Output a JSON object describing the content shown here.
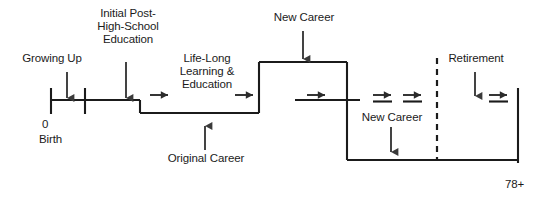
{
  "diagram": {
    "type": "timeline-step-diagram",
    "background_color": "#ffffff",
    "line_color": "#1b1b1b",
    "text_color": "#1b1b1b",
    "canvas": {
      "width": 546,
      "height": 202
    },
    "axis": {
      "start_value": "0",
      "start_label": "Birth",
      "end_label": "78+"
    },
    "labels": {
      "growing_up": "Growing Up",
      "initial_education": "Initial Post-\nHigh-School\nEducation",
      "lifelong_learning": "Life-Long\nLearning &\nEducation",
      "new_career_top": "New Career",
      "retirement": "Retirement",
      "original_career": "Original Career",
      "new_career_bottom": "New Career",
      "axis_zero": "0",
      "axis_birth": "Birth",
      "axis_end": "78+"
    },
    "flow_arrows": {
      "count": 7,
      "glyph": "arrow-right"
    },
    "callout_arrows": {
      "growing_up": "arrow-down",
      "initial_education": "arrow-down",
      "new_career_top": "arrow-down",
      "retirement": "arrow-down",
      "original_career": "arrow-up",
      "new_career_bottom": "arrow-down"
    },
    "divider": {
      "style": "dashed",
      "name": "retirement-divider"
    }
  }
}
